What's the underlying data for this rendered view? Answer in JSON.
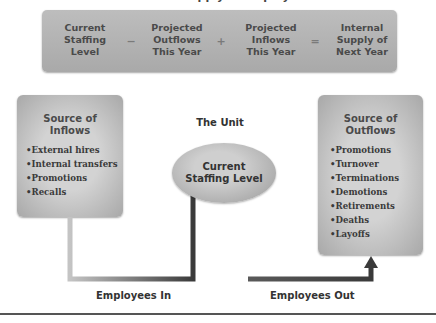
{
  "title_fragment": "Internal Supply of Employees",
  "formula": {
    "terms": [
      {
        "label": "Current\nStaffing\nLevel"
      },
      {
        "label": "Projected\nOutflows\nThis Year"
      },
      {
        "label": "Projected\nInflows\nThis Year"
      },
      {
        "label": "Internal\nSupply of\nNext Year"
      }
    ],
    "operators": [
      "−",
      "+",
      "="
    ]
  },
  "inflows": {
    "title": "Source of\nInflows",
    "items": [
      "External hires",
      "Internal transfers",
      "Promotions",
      "Recalls"
    ]
  },
  "outflows": {
    "title": "Source of\nOutflows",
    "items": [
      "Promotions",
      "Turnover",
      "Terminations",
      "Demotions",
      "Retirements",
      "Deaths",
      "Layoffs"
    ]
  },
  "unit": {
    "label": "The Unit",
    "center": "Current\nStaffing Level"
  },
  "flows": {
    "in_label": "Employees In",
    "out_label": "Employees Out"
  },
  "colors": {
    "box_fill": "#b4b4b4",
    "arrow_dark": "#3a3a3a",
    "arrow_light": "#bdbdbd"
  }
}
